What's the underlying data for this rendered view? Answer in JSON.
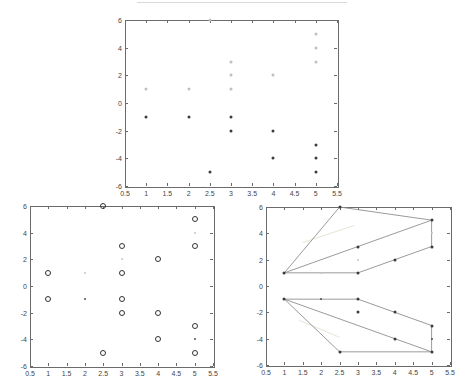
{
  "figure": {
    "background": "#ffffff",
    "artifact_line_present": true
  },
  "colors": {
    "axis_box": "#6b6b6b",
    "tick": "#6b6b6b",
    "tick_label": "#454545",
    "hull_line": "#8f8f8f",
    "ghost_line": "#e8e4d6",
    "marker_light": "#bfbfbf",
    "marker_dark": "#3c3c3c",
    "ring_stroke": "#333333",
    "small_dark": "#4f4f4f",
    "small_light": "#c6c6c6",
    "artifact": "#d9d9d9"
  },
  "axes": {
    "xlim": [
      0.5,
      5.5
    ],
    "ylim": [
      -6,
      6
    ],
    "xtick_labels": [
      "0.5",
      "1",
      "1.5",
      "2",
      "2.5",
      "3",
      "3.5",
      "4",
      "4.5",
      "5",
      "5.5"
    ],
    "xtick_values": [
      0.5,
      1,
      1.5,
      2,
      2.5,
      3,
      3.5,
      4,
      4.5,
      5,
      5.5
    ],
    "ytick_labels": [
      "6",
      "4",
      "2",
      "0",
      "-2",
      "-4",
      "-6"
    ],
    "ytick_values": [
      6,
      4,
      2,
      0,
      -2,
      -4,
      -6
    ],
    "grid": false,
    "box": true
  },
  "chart_data": [
    {
      "id": "top-scatter",
      "type": "scatter",
      "title": "",
      "xlabel": "",
      "ylabel": "",
      "xlim": [
        0.5,
        5.5
      ],
      "ylim": [
        -6,
        6
      ],
      "series": [
        {
          "name": "upper-cluster-light-points",
          "marker": "dot",
          "color_key": "marker_light",
          "points": [
            [
              1,
              1
            ],
            [
              2,
              1
            ],
            [
              3,
              1
            ],
            [
              3,
              2
            ],
            [
              4,
              2
            ],
            [
              3,
              3
            ],
            [
              5,
              3
            ],
            [
              5,
              4
            ],
            [
              5,
              5
            ],
            [
              2.5,
              6
            ]
          ]
        },
        {
          "name": "lower-cluster-dark-points",
          "marker": "dot",
          "color_key": "marker_dark",
          "points": [
            [
              1,
              -1
            ],
            [
              2,
              -1
            ],
            [
              3,
              -1
            ],
            [
              3,
              -2
            ],
            [
              4,
              -2
            ],
            [
              5,
              -3
            ],
            [
              4,
              -4
            ],
            [
              5,
              -4
            ],
            [
              2.5,
              -5
            ],
            [
              5,
              -5
            ]
          ]
        }
      ]
    },
    {
      "id": "bottom-left-scatter",
      "type": "scatter",
      "title": "",
      "xlabel": "",
      "ylabel": "",
      "xlim": [
        0.5,
        5.5
      ],
      "ylim": [
        -6,
        6
      ],
      "series": [
        {
          "name": "circled-points",
          "marker": "ring",
          "color_key": "ring_stroke",
          "points": [
            [
              1,
              1
            ],
            [
              3,
              1
            ],
            [
              4,
              2
            ],
            [
              3,
              3
            ],
            [
              5,
              3
            ],
            [
              5,
              5
            ],
            [
              2.5,
              6
            ],
            [
              1,
              -1
            ],
            [
              3,
              -1
            ],
            [
              3,
              -2
            ],
            [
              4,
              -2
            ],
            [
              5,
              -3
            ],
            [
              4,
              -4
            ],
            [
              2.5,
              -5
            ],
            [
              5,
              -5
            ]
          ]
        },
        {
          "name": "faint-small-dots",
          "marker": "small-dot",
          "color_key": "small_light",
          "points": [
            [
              2,
              1
            ],
            [
              3,
              2
            ],
            [
              5,
              4
            ]
          ]
        },
        {
          "name": "small-dark-dots",
          "marker": "small-dot",
          "color_key": "small_dark",
          "points": [
            [
              2,
              -1
            ],
            [
              5,
              -4
            ]
          ]
        }
      ]
    },
    {
      "id": "bottom-right-hulls",
      "type": "scatter",
      "title": "",
      "xlabel": "",
      "ylabel": "",
      "xlim": [
        0.5,
        5.5
      ],
      "ylim": [
        -6,
        6
      ],
      "series": [
        {
          "name": "cluster-points-dark",
          "marker": "dot",
          "color_key": "marker_dark",
          "points": [
            [
              1,
              1
            ],
            [
              3,
              1
            ],
            [
              4,
              2
            ],
            [
              3,
              3
            ],
            [
              5,
              3
            ],
            [
              5,
              5
            ],
            [
              2.5,
              6
            ],
            [
              1,
              -1
            ],
            [
              3,
              -1
            ],
            [
              3,
              -2
            ],
            [
              4,
              -2
            ],
            [
              5,
              -3
            ],
            [
              4,
              -4
            ],
            [
              2.5,
              -5
            ],
            [
              5,
              -5
            ]
          ]
        },
        {
          "name": "cluster-points-faint",
          "marker": "small-dot",
          "color_key": "small_light",
          "points": [
            [
              2,
              1
            ],
            [
              3,
              2
            ],
            [
              5,
              4
            ]
          ]
        },
        {
          "name": "cluster-points-small-dark",
          "marker": "small-dot",
          "color_key": "small_dark",
          "points": [
            [
              2,
              -1
            ],
            [
              5,
              -4
            ]
          ]
        }
      ],
      "segments": {
        "upper_hull": [
          [
            [
              1,
              1
            ],
            [
              2.5,
              6
            ]
          ],
          [
            [
              2.5,
              6
            ],
            [
              5,
              5
            ]
          ],
          [
            [
              5,
              5
            ],
            [
              5,
              3
            ]
          ],
          [
            [
              5,
              3
            ],
            [
              3,
              1
            ]
          ],
          [
            [
              3,
              1
            ],
            [
              1,
              1
            ]
          ],
          [
            [
              1,
              1
            ],
            [
              5,
              5
            ]
          ]
        ],
        "lower_hull": [
          [
            [
              1,
              -1
            ],
            [
              3,
              -1
            ]
          ],
          [
            [
              3,
              -1
            ],
            [
              5,
              -3
            ]
          ],
          [
            [
              5,
              -3
            ],
            [
              5,
              -5
            ]
          ],
          [
            [
              5,
              -5
            ],
            [
              2.5,
              -5
            ]
          ],
          [
            [
              2.5,
              -5
            ],
            [
              1,
              -1
            ]
          ],
          [
            [
              1,
              -1
            ],
            [
              5,
              -5
            ]
          ]
        ],
        "ghost_lines": [
          [
            [
              1.5,
              3.3
            ],
            [
              2.9,
              4.6
            ]
          ],
          [
            [
              1.4,
              -2.6
            ],
            [
              2.5,
              -3.9
            ]
          ]
        ]
      }
    }
  ]
}
